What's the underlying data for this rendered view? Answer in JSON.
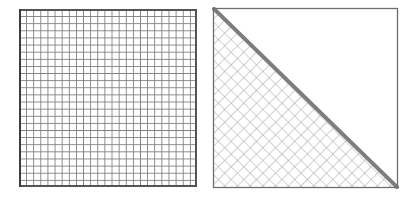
{
  "figure": {
    "title": "",
    "background_color": "#ffffff",
    "width": 417,
    "height": 200,
    "panel_count": 2,
    "panels": [
      {
        "id": "left-mesh-panel",
        "name": "uniform-square-mesh",
        "description": "Square domain filled with an axis-aligned uniform quadrilateral mesh",
        "x": 19,
        "y": 9,
        "width": 178,
        "height": 178,
        "mesh": {
          "type": "structured-quad",
          "orientation": "axis-aligned",
          "divisions_x": 25,
          "divisions_y": 25,
          "cell_size": 7.12,
          "line_color": "#808080",
          "line_width": 1,
          "fill_color": "#ffffff"
        },
        "border": {
          "color": "#555555",
          "width": 1.6,
          "left_edge_color": "#3c3c3c",
          "left_edge_width": 2.4
        },
        "diagonal": null,
        "hatch_region": null
      },
      {
        "id": "right-mesh-panel",
        "name": "diagonal-split-rotated-mesh",
        "description": "Square domain with a diagonal interface from top-left to bottom-right; lower-left triangle filled with a 45-degree rotated mesh, upper-right triangle empty",
        "x": 212,
        "y": 7,
        "width": 187,
        "height": 182,
        "mesh": {
          "type": "structured-quad",
          "orientation": "rotated-45",
          "cell_size": 9.0,
          "line_color": "#a8a8a8",
          "line_width": 1.1,
          "fill_color": "#ffffff",
          "boundary_style": "staircase"
        },
        "border": {
          "color": "#6e6e6e",
          "width": 1.3,
          "left_edge_color": "#6e6e6e",
          "left_edge_width": 1.3
        },
        "diagonal": {
          "from": "top-left",
          "to": "bottom-right",
          "color": "#7d7d7d",
          "width": 4.0
        },
        "hatch_region": {
          "location": "lower-left-triangle",
          "vertices": "top-left, bottom-left, bottom-right"
        }
      }
    ]
  },
  "colors": {
    "background": "#ffffff",
    "mesh_line_left": "#808080",
    "mesh_line_right": "#a8a8a8",
    "border_dark": "#3c3c3c",
    "border_medium": "#555555",
    "border_light": "#6e6e6e",
    "diagonal_line": "#7d7d7d"
  }
}
